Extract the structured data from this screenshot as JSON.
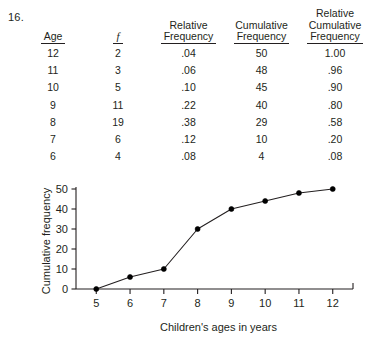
{
  "problem16": {
    "number": "16.",
    "table": {
      "headers": [
        {
          "lines": [
            "Age"
          ]
        },
        {
          "lines": [
            "f"
          ],
          "italic": true
        },
        {
          "lines": [
            "Relative",
            "Frequency"
          ]
        },
        {
          "lines": [
            "Cumulative",
            "Frequency"
          ]
        },
        {
          "lines": [
            "Relative",
            "Cumulative",
            "Frequency"
          ]
        }
      ],
      "rows": [
        [
          "12",
          "2",
          ".04",
          "50",
          "1.00"
        ],
        [
          "11",
          "3",
          ".06",
          "48",
          ".96"
        ],
        [
          "10",
          "5",
          ".10",
          "45",
          ".90"
        ],
        [
          "9",
          "11",
          ".22",
          "40",
          ".80"
        ],
        [
          "8",
          "19",
          ".38",
          "29",
          ".58"
        ],
        [
          "7",
          "6",
          ".12",
          "10",
          ".20"
        ],
        [
          "6",
          "4",
          ".08",
          "4",
          ".08"
        ]
      ]
    }
  },
  "problem17": {
    "number": "17."
  },
  "chart_data": {
    "type": "line",
    "title": "",
    "xlabel": "Children's ages in years",
    "ylabel": "Cumulative frequency",
    "x": [
      5,
      6,
      7,
      8,
      9,
      10,
      11,
      12
    ],
    "values": [
      0,
      6,
      10,
      30,
      40,
      44,
      48,
      50
    ],
    "xticklabels": [
      "5",
      "6",
      "7",
      "8",
      "9",
      "10",
      "11",
      "12"
    ],
    "yticklabels": [
      "0",
      "10",
      "20",
      "30",
      "40",
      "50"
    ],
    "yticks": [
      0,
      10,
      20,
      30,
      40,
      50
    ],
    "xlim": [
      4.4,
      12.6
    ],
    "ylim": [
      0,
      52
    ],
    "grid": false,
    "legend": false,
    "marker": "filled-circle",
    "line_color": "#231f20",
    "marker_color": "#000000"
  }
}
